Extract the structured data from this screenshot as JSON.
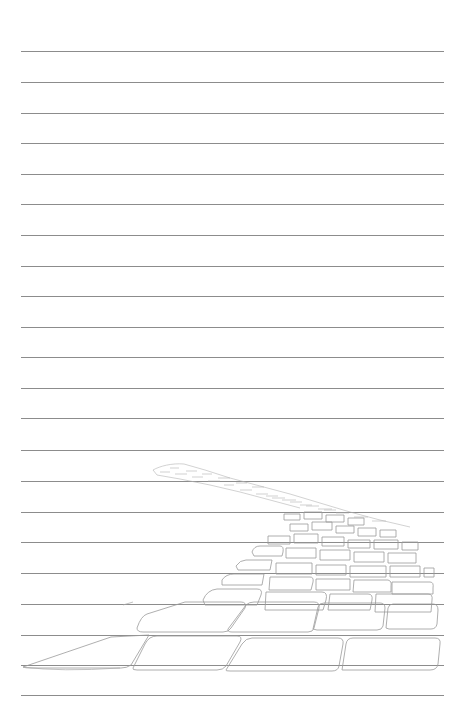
{
  "page": {
    "type": "lined-stationery",
    "background": "#ffffff",
    "rule_color": "#8c8c8c",
    "rule_left": 21,
    "rule_width": 423,
    "rule_positions": [
      51,
      82,
      113,
      143,
      174,
      204,
      235,
      266,
      296,
      327,
      357,
      388,
      418,
      450,
      481,
      512,
      542,
      573,
      604,
      635,
      665,
      695
    ]
  },
  "illustration": {
    "subject": "cobblestone-path-sketch",
    "style": "pencil line drawing",
    "stroke_color": "#9a9a9a"
  }
}
